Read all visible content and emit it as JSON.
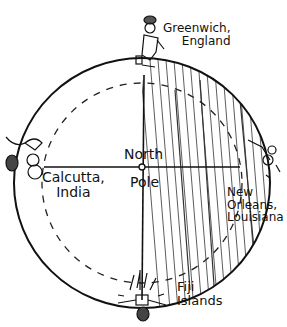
{
  "diagram": {
    "center_label_line1": "North",
    "center_label_line2": "Pole",
    "locations": [
      {
        "name": "greenwich",
        "line1": "Greenwich,",
        "line2": "England",
        "position": "top"
      },
      {
        "name": "calcutta",
        "line1": "Calcutta,",
        "line2": "India",
        "position": "left"
      },
      {
        "name": "new-orleans",
        "line1": "New",
        "line2": "Orleans,",
        "line3": "Louisiana",
        "position": "right"
      },
      {
        "name": "fiji",
        "line1": "Fiji",
        "line2": "Islands",
        "position": "bottom"
      }
    ],
    "colors": {
      "ink": "#111111",
      "background": "#ffffff"
    }
  }
}
